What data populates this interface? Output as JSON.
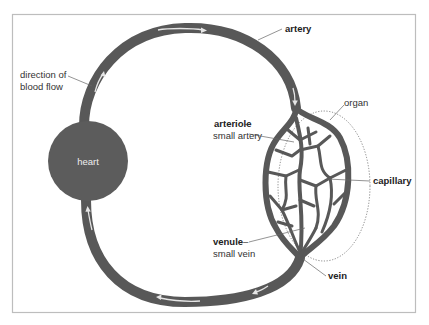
{
  "diagram": {
    "colors": {
      "vessel": "#585858",
      "heart": "#5c5c5c",
      "arrow": "#e6e6e6",
      "frame": "#bdbdbd",
      "organ_outline": "#777777"
    },
    "nodes": {
      "heart": "heart"
    },
    "labels": {
      "direction": [
        "direction of",
        "blood flow"
      ],
      "artery": "artery",
      "arteriole": "arteriole",
      "arteriole_dash": "–",
      "arteriole_desc": "small artery",
      "organ": "organ",
      "capillary": "capillary",
      "venule": "venule",
      "venule_dash": "–",
      "venule_desc": "small vein",
      "vein": "vein"
    },
    "icons": {
      "flow_arrow": "arrow-icon"
    }
  }
}
